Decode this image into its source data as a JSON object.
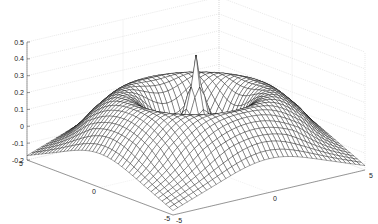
{
  "chart_data": {
    "type": "surface",
    "title": "",
    "xlabel": "",
    "ylabel": "",
    "zlabel": "",
    "xlim": [
      -5,
      5
    ],
    "ylim": [
      -5,
      5
    ],
    "zlim": [
      -0.2,
      0.5
    ],
    "x_ticks": [
      -5,
      0,
      5
    ],
    "y_ticks": [
      -5,
      0,
      5
    ],
    "z_ticks": [
      -0.2,
      -0.1,
      0,
      0.1,
      0.2,
      0.3,
      0.4,
      0.5
    ],
    "x_tick_labels": [
      "-5",
      "0",
      "5"
    ],
    "y_tick_labels": [
      "-5",
      "0",
      "5"
    ],
    "z_tick_labels": [
      "-0.2",
      "-0.1",
      "0",
      "0.1",
      "0.2",
      "0.3",
      "0.4",
      "0.5"
    ],
    "grid": true,
    "style": "mesh",
    "mesh_color": "#000000",
    "face_color": "#ffffff",
    "peak": {
      "x": 0,
      "y": 0,
      "z": 0.45
    },
    "grid_resolution": 41
  }
}
